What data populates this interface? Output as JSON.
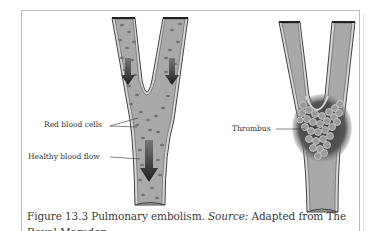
{
  "figure": {
    "number": "Figure 13.3",
    "title": "Pulmonary embolism.",
    "source_label": "Source:",
    "source_text": "Adapted from The",
    "caption_line2_partial": "Royal Marsden..."
  },
  "left_panel": {
    "description": "Healthy branching vessel",
    "labels": {
      "red_blood_cells": "Red blood cells",
      "healthy_flow": "Healthy blood flow"
    }
  },
  "right_panel": {
    "description": "Vessel blocked by thrombus",
    "labels": {
      "thrombus": "Thrombus"
    }
  },
  "colors": {
    "vessel_fill": "#a8a8a8",
    "vessel_wall": "#d4d4d4",
    "vessel_outline": "#444444",
    "cell": "#7a7a7a",
    "arrow": "#2a2a2a",
    "thrombus_shadow": "#555555",
    "frame": "#bdbdbd"
  }
}
